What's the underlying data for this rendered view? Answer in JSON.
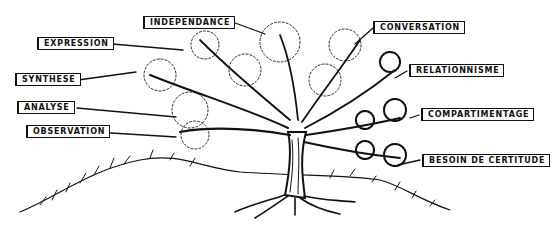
{
  "figure": {
    "type": "hand-drawn tree illustration",
    "colors": {
      "ink": "#111111",
      "background": "#ffffff"
    }
  },
  "labels": {
    "independance": "INDEPENDANCE",
    "expression": "EXPRESSION",
    "synthese": "SYNTHESE",
    "analyse": "ANALYSE",
    "observation": "OBSERVATION",
    "conversation": "CONVERSATION",
    "relationnisme": "RELATIONNISME",
    "compartimentage": "COMPARTIMENTAGE",
    "besoin_de_certitude": "BESOIN DE CERTITUDE"
  }
}
